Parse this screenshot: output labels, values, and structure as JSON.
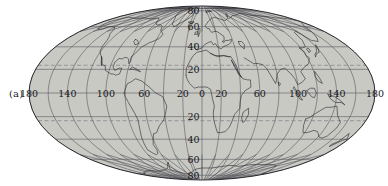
{
  "figure": {
    "panel_label": "(a)",
    "projection": "Mollweide",
    "background_color": "#ffffff",
    "ocean_fill": "#c9c9c4",
    "graticule_color": "#55555c",
    "coastline_color": "#2a2a30",
    "tropic_line_color": "#7b7b86",
    "outline_color": "#2a2a30"
  },
  "chart_data": {
    "type": "map",
    "title": "",
    "projection": "Mollweide",
    "center_longitude": 0,
    "xlabel": "",
    "ylabel": "",
    "xlim": [
      -180,
      180
    ],
    "ylim": [
      -90,
      90
    ],
    "grid": true,
    "legend": "none",
    "graticule": {
      "longitude_interval": 20,
      "latitude_interval": 20,
      "longitude_lines": [
        -180,
        -160,
        -140,
        -120,
        -100,
        -80,
        -60,
        -40,
        -20,
        0,
        20,
        40,
        60,
        80,
        100,
        120,
        140,
        160,
        180
      ],
      "latitude_lines": [
        -80,
        -60,
        -40,
        -20,
        0,
        20,
        40,
        60,
        80
      ]
    },
    "longitude_tick_labels": [
      {
        "value": -180,
        "text": "180"
      },
      {
        "value": -140,
        "text": "140"
      },
      {
        "value": -100,
        "text": "100"
      },
      {
        "value": -60,
        "text": "60"
      },
      {
        "value": -20,
        "text": "20"
      },
      {
        "value": 0,
        "text": "0"
      },
      {
        "value": 20,
        "text": "20"
      },
      {
        "value": 60,
        "text": "60"
      },
      {
        "value": 100,
        "text": "100"
      },
      {
        "value": 140,
        "text": "140"
      },
      {
        "value": 180,
        "text": "180"
      }
    ],
    "latitude_tick_labels": [
      {
        "value": 80,
        "text": "80"
      },
      {
        "value": 60,
        "text": "60"
      },
      {
        "value": 40,
        "text": "40"
      },
      {
        "value": 20,
        "text": "20"
      },
      {
        "value": 0,
        "text": "0"
      },
      {
        "value": -20,
        "text": "20"
      },
      {
        "value": -40,
        "text": "40"
      },
      {
        "value": -60,
        "text": "60"
      },
      {
        "value": -80,
        "text": "80"
      }
    ],
    "annotation_lines": [
      {
        "name": "tropic-of-cancer",
        "latitude": 23.5,
        "style": "dashed"
      },
      {
        "name": "tropic-of-capricorn",
        "latitude": -23.5,
        "style": "dashed"
      }
    ]
  }
}
